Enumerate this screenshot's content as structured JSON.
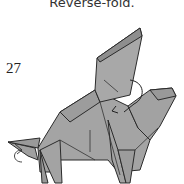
{
  "caption": "Reverse-fold.",
  "step_number": "27",
  "diagram": {
    "paper_color": "#a3a3a3",
    "edge_color": "#2b2b2b",
    "arrows": [
      "curved-fold-arrow",
      "reverse-fold-indicator"
    ]
  }
}
